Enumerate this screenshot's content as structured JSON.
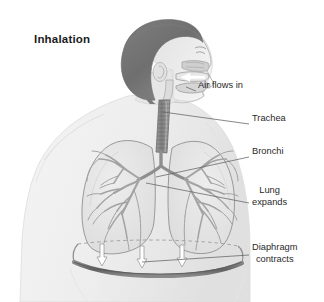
{
  "figure": {
    "title": "Inhalation",
    "background_color": "#ffffff",
    "text_color": "#2a2a2a",
    "title_color": "#1b1b1b",
    "width": 324,
    "height": 302
  },
  "palette": {
    "hair_dark": "#6f6f6f",
    "hair_mid": "#8a8a8a",
    "skin_light": "#e8e8e8",
    "skin_shadow": "#d2d2d2",
    "body_silhouette": "#ededed",
    "lung_fill": "#e4e4e4",
    "lung_outline": "#9a9a9a",
    "bronchi": "#a9a9a9",
    "trachea": "#8f8f8f",
    "diaphragm": "#6b6b6b",
    "leader_line": "#6a6a6a",
    "arrow_white": "#ffffff"
  },
  "callouts": [
    {
      "id": "air-flows-in",
      "label": "Air flows in",
      "line1": "Air flows in",
      "line2": "",
      "x": 198,
      "y": 86,
      "leader": {
        "x1": 196,
        "y1": 91,
        "x2": 184,
        "y2": 86
      }
    },
    {
      "id": "trachea",
      "label": "Trachea",
      "line1": "Trachea",
      "line2": "",
      "x": 252,
      "y": 119,
      "leader": {
        "x1": 249,
        "y1": 124,
        "x2": 163,
        "y2": 112
      }
    },
    {
      "id": "bronchi",
      "label": "Bronchi",
      "line1": "Bronchi",
      "line2": "",
      "x": 252,
      "y": 152,
      "leader": {
        "x1": 249,
        "y1": 157,
        "x2": 156,
        "y2": 176
      }
    },
    {
      "id": "lung-expands",
      "label": "Lung expands",
      "line1": "Lung",
      "line2": "expands",
      "x": 252,
      "y": 191,
      "leader": {
        "x1": 249,
        "y1": 203,
        "x2": 145,
        "y2": 182
      }
    },
    {
      "id": "diaphragm-contracts",
      "label": "Diaphragm contracts",
      "line1": "Diaphragm",
      "line2": "contracts",
      "x": 252,
      "y": 248,
      "leader": {
        "x1": 249,
        "y1": 255,
        "x2": 140,
        "y2": 262
      }
    }
  ],
  "anatomy": {
    "airflow_arrow": "white-arrow-in-oral-nasal-cavity-pointing-inward",
    "diaphragm_arrows": [
      {
        "x": 102,
        "y": 252
      },
      {
        "x": 142,
        "y": 252
      },
      {
        "x": 182,
        "y": 252
      }
    ],
    "diaphragm_rest_line": "dashed-horizontal-line-above-diaphragm",
    "lungs": [
      "left-lung",
      "right-lung"
    ],
    "bronchial_tree": "branching-airways-filling-both-lungs"
  }
}
